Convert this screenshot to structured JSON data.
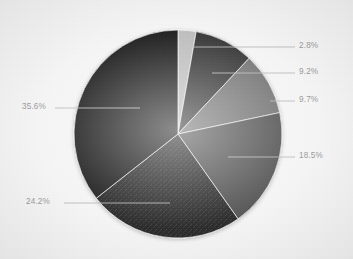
{
  "chart_data": {
    "type": "pie",
    "title": "",
    "subtitle": "",
    "xlabel": "",
    "ylabel": "",
    "grid": false,
    "legend": "none",
    "label_format": "percent",
    "start_angle_deg": 0,
    "direction": "clockwise",
    "categories": [
      "Slice 1",
      "Slice 2",
      "Slice 3",
      "Slice 4",
      "Slice 5",
      "Slice 6"
    ],
    "values": [
      2.8,
      9.2,
      9.7,
      18.5,
      24.2,
      35.6
    ],
    "labels": [
      "2.8%",
      "9.2%",
      "9.7%",
      "18.5%",
      "24.2%",
      "35.6%"
    ],
    "colors": [
      "#b5b5b5",
      "#1c1c1c",
      "#636363",
      "#3c3c3c",
      "#101010",
      "#050505"
    ],
    "total": 100.0,
    "annotations": []
  },
  "chart": {
    "background_color": "#f4f4f4",
    "label_color": "#8d8d8d",
    "leader_line_color": "#b0b0b0",
    "center_x": 178,
    "center_y": 134,
    "radius": 104
  },
  "slices": [
    {
      "label": "2.8%",
      "value": 2.8,
      "color": "#b5b5b5",
      "side": "right",
      "label_x": 299,
      "label_y": 42,
      "leader_x1": 193,
      "leader_y1": 47,
      "leader_x2": 295,
      "leader_y2": 47
    },
    {
      "label": "9.2%",
      "value": 9.2,
      "color": "#1c1c1c",
      "side": "right",
      "label_x": 299,
      "label_y": 68,
      "leader_x1": 212,
      "leader_y1": 73,
      "leader_x2": 295,
      "leader_y2": 73
    },
    {
      "label": "9.7%",
      "value": 9.7,
      "color": "#636363",
      "side": "right",
      "label_x": 299,
      "label_y": 96,
      "leader_x1": 270,
      "leader_y1": 101,
      "leader_x2": 295,
      "leader_y2": 101
    },
    {
      "label": "18.5%",
      "value": 18.5,
      "color": "#3c3c3c",
      "side": "right",
      "label_x": 299,
      "label_y": 152,
      "leader_x1": 228,
      "leader_y1": 157,
      "leader_x2": 295,
      "leader_y2": 157
    },
    {
      "label": "24.2%",
      "value": 24.2,
      "color": "#101010",
      "side": "left",
      "label_x": 26,
      "label_y": 198,
      "leader_x1": 64,
      "leader_y1": 203,
      "leader_x2": 170,
      "leader_y2": 203
    },
    {
      "label": "35.6%",
      "value": 35.6,
      "color": "#050505",
      "side": "left",
      "label_x": 22,
      "label_y": 103,
      "leader_x1": 55,
      "leader_y1": 108,
      "leader_x2": 140,
      "leader_y2": 108
    }
  ]
}
